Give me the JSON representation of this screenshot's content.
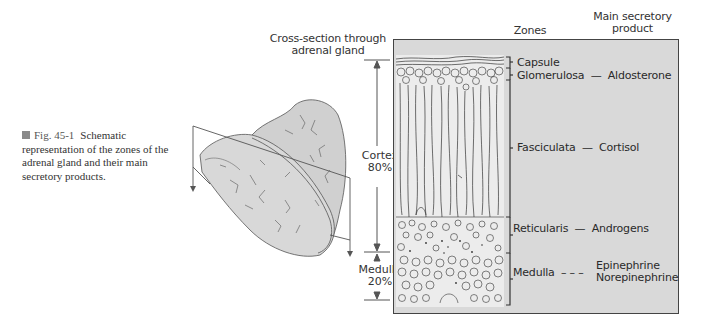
{
  "caption": {
    "figure_number": "Fig. 45-1",
    "text": "Schematic representation of the zones of the adrenal gland and their main secretory products."
  },
  "headers": {
    "cross_section": [
      "Cross-section through",
      "adrenal gland"
    ],
    "zones": "Zones",
    "product": [
      "Main secretory",
      "product"
    ]
  },
  "proportions": [
    {
      "name": "Cortex",
      "percent": "80%"
    },
    {
      "name": "Medulla",
      "percent": "20%"
    }
  ],
  "zones": [
    {
      "zone": "Capsule",
      "separator": "",
      "product": ""
    },
    {
      "zone": "Glomerulosa",
      "separator": "—",
      "product": "Aldosterone"
    },
    {
      "zone": "Fasciculata",
      "separator": "—",
      "product": "Cortisol"
    },
    {
      "zone": "Reticularis",
      "separator": "—",
      "product": "Androgens"
    },
    {
      "zone": "Medulla",
      "separator": "– – –",
      "product": "Epinephrine",
      "product2": "Norepinephrine"
    }
  ],
  "colors": {
    "panel_fill": "#d9d9d9",
    "line": "#444444",
    "gland_fill": "#d4d4d4",
    "caption_square": "#8a8a8a"
  }
}
